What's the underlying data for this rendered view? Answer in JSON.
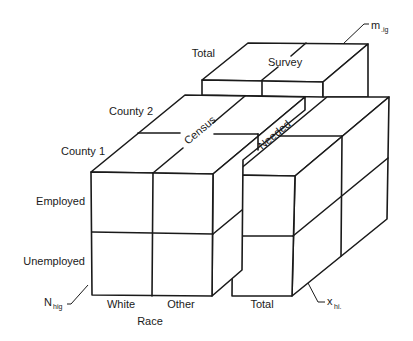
{
  "diagram": {
    "type": "3D block diagram (cross-classified table cube)",
    "blocks": {
      "survey": {
        "label": "Survey",
        "row_label": "Total"
      },
      "census": {
        "label": "Census"
      },
      "needed": {
        "label": "Needed"
      }
    },
    "left_axis": {
      "depth_labels": [
        "County 2",
        "County 1"
      ],
      "row_labels": [
        "Employed",
        "Unemployed"
      ]
    },
    "bottom_axis": {
      "column_labels": [
        "White",
        "Other",
        "Total"
      ],
      "axis_title": "Race"
    },
    "annotations": {
      "n_hig": {
        "main": "N",
        "sub": "hig"
      },
      "m_ig": {
        "main": "m",
        "sub": ".ig"
      },
      "x_hi": {
        "main": "x",
        "sub": "hi."
      }
    },
    "colors": {
      "line": "#1a1a1a",
      "background": "#ffffff"
    }
  }
}
